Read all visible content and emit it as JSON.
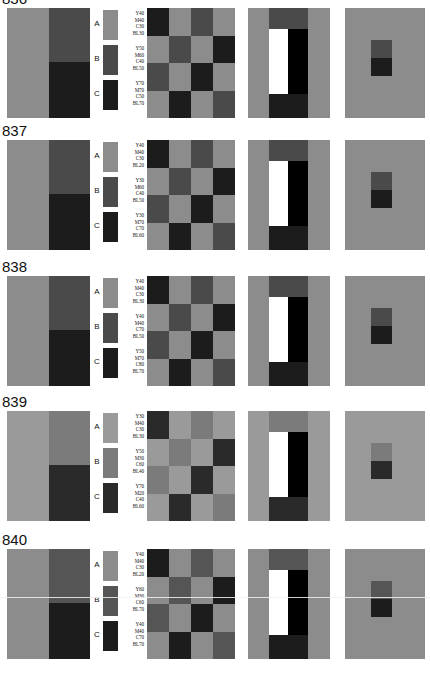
{
  "figure": {
    "panel_count_per_row": 5,
    "legend_letters": [
      "A",
      "B",
      "C"
    ]
  },
  "rows": [
    {
      "label": "836",
      "legend": [
        {
          "letter": "A",
          "swatch": "#8c8c8c",
          "lines": [
            "Y40",
            "M40",
            "C30",
            "BL30"
          ]
        },
        {
          "letter": "B",
          "swatch": "#4a4a4a",
          "lines": [
            "Y50",
            "M60",
            "C40",
            "BL50"
          ]
        },
        {
          "letter": "C",
          "swatch": "#1c1c1c",
          "lines": [
            "Y70",
            "M70",
            "C50",
            "BL70"
          ]
        }
      ],
      "panel1": {
        "left": "#8c8c8c",
        "right_top": "#4a4a4a",
        "right_bottom": "#1c1c1c"
      },
      "panel3": [
        "#1c1c1c",
        "#8c8c8c",
        "#4a4a4a",
        "#8c8c8c",
        "#8c8c8c",
        "#4a4a4a",
        "#8c8c8c",
        "#1c1c1c",
        "#4a4a4a",
        "#8c8c8c",
        "#1c1c1c",
        "#8c8c8c",
        "#8c8c8c",
        "#1c1c1c",
        "#8c8c8c",
        "#4a4a4a"
      ],
      "panel4": {
        "bg": "#8c8c8c",
        "top": "#4a4a4a",
        "bottom": "#1c1c1c",
        "white": "#ffffff",
        "black": "#000000"
      },
      "panel5": {
        "bg": "#8c8c8c",
        "square_top": "#4a4a4a",
        "square_bottom": "#1c1c1c"
      }
    },
    {
      "label": "837",
      "legend": [
        {
          "letter": "A",
          "swatch": "#8c8c8c",
          "lines": [
            "Y40",
            "M40",
            "C30",
            "BL20"
          ]
        },
        {
          "letter": "B",
          "swatch": "#4a4a4a",
          "lines": [
            "Y30",
            "M60",
            "C40",
            "BL50"
          ]
        },
        {
          "letter": "C",
          "swatch": "#1c1c1c",
          "lines": [
            "Y30",
            "M70",
            "C70",
            "BL60"
          ]
        }
      ],
      "panel1": {
        "left": "#8c8c8c",
        "right_top": "#4a4a4a",
        "right_bottom": "#1c1c1c"
      },
      "panel3": [
        "#1c1c1c",
        "#8c8c8c",
        "#4a4a4a",
        "#8c8c8c",
        "#8c8c8c",
        "#4a4a4a",
        "#8c8c8c",
        "#1c1c1c",
        "#4a4a4a",
        "#8c8c8c",
        "#1c1c1c",
        "#8c8c8c",
        "#8c8c8c",
        "#1c1c1c",
        "#8c8c8c",
        "#4a4a4a"
      ],
      "panel4": {
        "bg": "#8c8c8c",
        "top": "#4a4a4a",
        "bottom": "#1c1c1c",
        "white": "#ffffff",
        "black": "#000000"
      },
      "panel5": {
        "bg": "#8c8c8c",
        "square_top": "#4a4a4a",
        "square_bottom": "#1c1c1c"
      }
    },
    {
      "label": "838",
      "legend": [
        {
          "letter": "A",
          "swatch": "#8c8c8c",
          "lines": [
            "Y40",
            "M40",
            "C30",
            "BL30"
          ]
        },
        {
          "letter": "B",
          "swatch": "#4a4a4a",
          "lines": [
            "Y40",
            "M40",
            "C70",
            "BL50"
          ]
        },
        {
          "letter": "C",
          "swatch": "#1c1c1c",
          "lines": [
            "Y50",
            "M70",
            "C80",
            "BL70"
          ]
        }
      ],
      "panel1": {
        "left": "#8c8c8c",
        "right_top": "#4a4a4a",
        "right_bottom": "#1c1c1c"
      },
      "panel3": [
        "#1c1c1c",
        "#8c8c8c",
        "#4a4a4a",
        "#8c8c8c",
        "#8c8c8c",
        "#4a4a4a",
        "#8c8c8c",
        "#1c1c1c",
        "#4a4a4a",
        "#8c8c8c",
        "#1c1c1c",
        "#8c8c8c",
        "#8c8c8c",
        "#1c1c1c",
        "#8c8c8c",
        "#4a4a4a"
      ],
      "panel4": {
        "bg": "#8c8c8c",
        "top": "#4a4a4a",
        "bottom": "#1c1c1c",
        "white": "#ffffff",
        "black": "#000000"
      },
      "panel5": {
        "bg": "#8c8c8c",
        "square_top": "#4a4a4a",
        "square_bottom": "#1c1c1c"
      }
    },
    {
      "label": "839",
      "legend": [
        {
          "letter": "A",
          "swatch": "#9a9a9a",
          "lines": [
            "Y30",
            "M40",
            "C30",
            "BL30"
          ]
        },
        {
          "letter": "B",
          "swatch": "#7b7b7b",
          "lines": [
            "Y50",
            "M30",
            "C60",
            "BL40"
          ]
        },
        {
          "letter": "C",
          "swatch": "#2a2a2a",
          "lines": [
            "Y70",
            "M20",
            "C40",
            "BL60"
          ]
        }
      ],
      "panel1": {
        "left": "#9a9a9a",
        "right_top": "#7b7b7b",
        "right_bottom": "#2a2a2a"
      },
      "panel3": [
        "#2a2a2a",
        "#9a9a9a",
        "#7b7b7b",
        "#9a9a9a",
        "#9a9a9a",
        "#7b7b7b",
        "#9a9a9a",
        "#2a2a2a",
        "#7b7b7b",
        "#9a9a9a",
        "#2a2a2a",
        "#9a9a9a",
        "#9a9a9a",
        "#2a2a2a",
        "#9a9a9a",
        "#7b7b7b"
      ],
      "panel4": {
        "bg": "#9a9a9a",
        "top": "#7b7b7b",
        "bottom": "#2a2a2a",
        "white": "#ffffff",
        "black": "#000000"
      },
      "panel5": {
        "bg": "#9a9a9a",
        "square_top": "#7b7b7b",
        "square_bottom": "#2a2a2a"
      }
    },
    {
      "label": "840",
      "legend": [
        {
          "letter": "A",
          "swatch": "#8c8c8c",
          "lines": [
            "Y40",
            "M40",
            "C30",
            "BL20"
          ]
        },
        {
          "letter": "B",
          "swatch": "#555555",
          "lines": [
            "Y60",
            "M30",
            "C60",
            "BL70"
          ]
        },
        {
          "letter": "C",
          "swatch": "#1c1c1c",
          "lines": [
            "Y40",
            "M40",
            "C70",
            "BL70"
          ]
        }
      ],
      "panel1": {
        "left": "#8c8c8c",
        "right_top": "#555555",
        "right_bottom": "#1c1c1c"
      },
      "panel3": [
        "#1c1c1c",
        "#8c8c8c",
        "#555555",
        "#8c8c8c",
        "#8c8c8c",
        "#555555",
        "#8c8c8c",
        "#1c1c1c",
        "#555555",
        "#8c8c8c",
        "#1c1c1c",
        "#8c8c8c",
        "#8c8c8c",
        "#1c1c1c",
        "#8c8c8c",
        "#555555"
      ],
      "panel4": {
        "bg": "#8c8c8c",
        "top": "#555555",
        "bottom": "#1c1c1c",
        "white": "#ffffff",
        "black": "#000000"
      },
      "panel5": {
        "bg": "#8c8c8c",
        "square_top": "#555555",
        "square_bottom": "#1c1c1c"
      },
      "scanline": true
    }
  ]
}
